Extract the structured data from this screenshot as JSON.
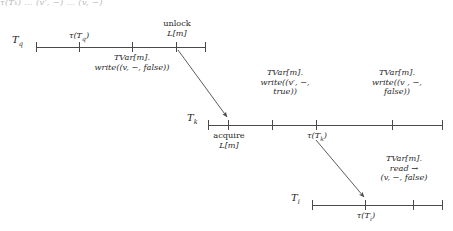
{
  "figure": {
    "title_cropped": "τ(Tₖ) … (v′, −) … (v, −)",
    "stroke_color": "#4a4a4a",
    "text_color": "#2a2a2a",
    "width": 453,
    "height": 231
  },
  "timelines": [
    {
      "id": "tq",
      "name": "T",
      "subscript": "q",
      "above_labels": [
        {
          "text": "τ(T",
          "sub": "q",
          "text_after": ")",
          "at_tick": 1
        },
        {
          "line1": "unlock",
          "line2": "L[m]",
          "at_tick": 3
        }
      ],
      "below_labels": [
        {
          "line1": "TVar[m].",
          "line2": "write((v, −, false))",
          "at_tick": 2
        }
      ]
    },
    {
      "id": "tk",
      "name": "T",
      "subscript": "k",
      "above_labels": [
        {
          "line1": "TVar[m].",
          "line2": "write((v′, −,",
          "line3": "true))",
          "at_tick": 2
        },
        {
          "line1": "TVar[m].",
          "line2": "write((v , −,",
          "line3": "false))",
          "at_tick": 4
        }
      ],
      "below_labels": [
        {
          "line1": "acquire",
          "line2": "L[m]",
          "at_tick": 1
        },
        {
          "line1": "τ(T",
          "sub": "k",
          "line1_after": ")",
          "at_tick": 3
        }
      ]
    },
    {
      "id": "ti",
      "name": "T",
      "subscript": "i",
      "above_labels": [
        {
          "line1": "TVar[m].",
          "line2": "read →",
          "line3": "(v, −, false)",
          "at_tick": 2
        }
      ],
      "below_labels": [
        {
          "line1": "τ(T",
          "sub": "i",
          "line1_after": ")",
          "at_tick": 1
        }
      ]
    }
  ],
  "text": {
    "tq_name": "T",
    "tq_sub": "q",
    "tk_name": "T",
    "tk_sub": "k",
    "ti_name": "T",
    "ti_sub": "i",
    "tau_open": "τ(T",
    "tau_close": ")",
    "unlock": "unlock",
    "lock_var": "L[m]",
    "acquire": "acquire",
    "tvar": "TVar[m].",
    "write_v_false_1": "write((v, −, false))",
    "write_vprime_true_l1": "write((v′, −,",
    "write_vprime_true_l2": "true))",
    "write_v_false_l1": "write((v , −,",
    "write_v_false_l2": "false))",
    "read_arrow": "read →",
    "read_result": "(v, −, false)"
  }
}
